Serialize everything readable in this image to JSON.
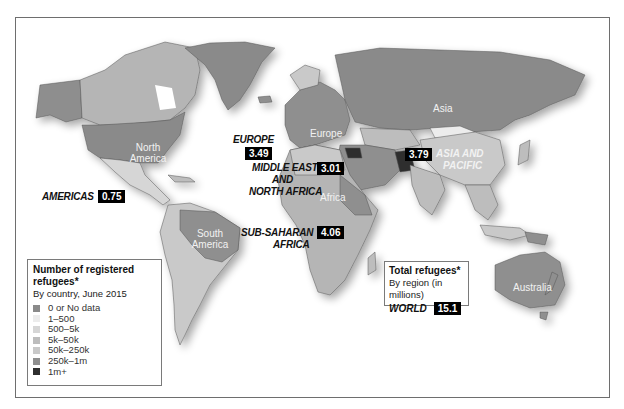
{
  "map": {
    "type": "choropleth",
    "subject": "Registered refugees by country and region"
  },
  "continent_labels": {
    "north_america": "North America",
    "south_america": "South America",
    "europe": "Europe",
    "africa": "Africa",
    "asia": "Asia",
    "australia": "Australia"
  },
  "regions": [
    {
      "name": "AMERICAS",
      "value": "0.75"
    },
    {
      "name": "EUROPE",
      "value": "3.49"
    },
    {
      "name": "MIDDLE EAST AND NORTH AFRICA",
      "value": "3.01"
    },
    {
      "name": "SUB-SAHARAN AFRICA",
      "value": "4.06"
    },
    {
      "name": "ASIA AND PACIFIC",
      "value": "3.79"
    }
  ],
  "region_labels": {
    "americas": "AMERICAS",
    "europe": "EUROPE",
    "mena_1": "MIDDLE EAST",
    "mena_2": "AND",
    "mena_3": "NORTH AFRICA",
    "ssa_1": "SUB-SAHARAN",
    "ssa_2": "AFRICA",
    "asia_1": "ASIA AND",
    "asia_2": "PACIFIC"
  },
  "region_values": {
    "americas": "0.75",
    "europe": "3.49",
    "mena": "3.01",
    "ssa": "4.06",
    "asia": "3.79"
  },
  "legend": {
    "title": "Number of registered refugees*",
    "subtitle": "By country, June 2015",
    "items": [
      {
        "label": "0 or No data",
        "color": "#8a8a8a"
      },
      {
        "label": "1–500",
        "color": "#ececec"
      },
      {
        "label": "500–5k",
        "color": "#d6d6d6"
      },
      {
        "label": "5k–50k",
        "color": "#bdbdbd"
      },
      {
        "label": "50k–250k",
        "color": "#c9c9c9"
      },
      {
        "label": "250k–1m",
        "color": "#8f8f8f"
      },
      {
        "label": "1m+",
        "color": "#2e2e2e"
      }
    ]
  },
  "total": {
    "title": "Total refugees*",
    "subtitle": "By region (in millions)",
    "world_label": "WORLD",
    "world_value": "15.1"
  }
}
